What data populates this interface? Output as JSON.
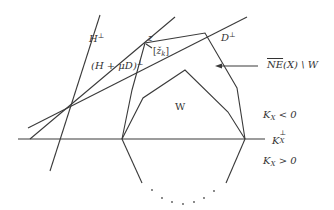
{
  "diagram": {
    "labels": {
      "h_perp": {
        "base": "H",
        "sup": "⊥"
      },
      "h_mu_d_perp": {
        "base": "(H + μD)",
        "sup": "⊥"
      },
      "z": "z",
      "z_k": {
        "open": "[",
        "base": "ž",
        "sub": "k",
        "close": "]"
      },
      "d_perp": {
        "base": "D",
        "sup": "⊥"
      },
      "ne_minus_w": {
        "over": "NE",
        "rest": "(X) \\ W"
      },
      "w": "W",
      "kx_neg": {
        "base": "K",
        "sub": "X",
        "rest": " < 0"
      },
      "kx_perp": {
        "base": "K",
        "sub": "X",
        "sup": "⊥"
      },
      "kx_pos": {
        "base": "K",
        "sub": "X",
        "rest": " > 0"
      }
    },
    "colors": {
      "stroke": "#3a3a3a",
      "text": "#333333",
      "background": "#ffffff"
    }
  }
}
